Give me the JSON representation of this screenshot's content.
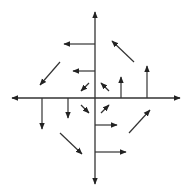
{
  "diagram": {
    "type": "vector-field",
    "colors": {
      "background": "#ffffff",
      "stroke": "#333333"
    },
    "origin": [
      95,
      98
    ],
    "axes": [
      {
        "name": "x-axis",
        "x1": 12,
        "y1": 98,
        "x2": 180,
        "y2": 98,
        "arrows": "both"
      },
      {
        "name": "y-axis",
        "x1": 95,
        "y1": 12,
        "x2": 95,
        "y2": 184,
        "arrows": "both"
      }
    ],
    "vectors": [
      {
        "name": "left-arrow-upper",
        "x1": 95,
        "y1": 44,
        "x2": 64,
        "y2": 44
      },
      {
        "name": "left-arrow-lower",
        "x1": 95,
        "y1": 71,
        "x2": 73,
        "y2": 71
      },
      {
        "name": "down-arrow-far",
        "x1": 42,
        "y1": 98,
        "x2": 42,
        "y2": 129
      },
      {
        "name": "down-arrow-near",
        "x1": 68,
        "y1": 98,
        "x2": 68,
        "y2": 118
      },
      {
        "name": "up-arrow-near",
        "x1": 121,
        "y1": 98,
        "x2": 121,
        "y2": 77
      },
      {
        "name": "up-arrow-far",
        "x1": 147,
        "y1": 98,
        "x2": 147,
        "y2": 66
      },
      {
        "name": "right-arrow-near",
        "x1": 95,
        "y1": 125,
        "x2": 117,
        "y2": 125
      },
      {
        "name": "right-arrow-far",
        "x1": 95,
        "y1": 152,
        "x2": 126,
        "y2": 152
      },
      {
        "name": "diag-arrow-upper-left",
        "x1": 60,
        "y1": 62,
        "x2": 40,
        "y2": 85
      },
      {
        "name": "diag-arrow-upper-right",
        "x1": 134,
        "y1": 62,
        "x2": 112,
        "y2": 41
      },
      {
        "name": "diag-arrow-lower-left",
        "x1": 60,
        "y1": 133,
        "x2": 82,
        "y2": 154
      },
      {
        "name": "diag-arrow-lower-right",
        "x1": 129,
        "y1": 133,
        "x2": 150,
        "y2": 110
      },
      {
        "name": "center-arrow-ul",
        "x1": 89,
        "y1": 83,
        "x2": 81,
        "y2": 91
      },
      {
        "name": "center-arrow-ur",
        "x1": 109,
        "y1": 91,
        "x2": 101,
        "y2": 83
      },
      {
        "name": "center-arrow-ll",
        "x1": 81,
        "y1": 105,
        "x2": 89,
        "y2": 113
      },
      {
        "name": "center-arrow-lr",
        "x1": 101,
        "y1": 113,
        "x2": 109,
        "y2": 105
      }
    ]
  }
}
